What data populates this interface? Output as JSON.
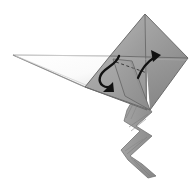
{
  "figure": {
    "title": "Origami fold step diagram",
    "domain_label": "origami-instruction",
    "background_color": "#ffffff"
  },
  "canvas": {
    "width": 196,
    "height": 183,
    "viewbox": "0 0 196 183"
  },
  "palette": {
    "paper_light": "#d2d2d2",
    "paper_mid": "#9a9a9a",
    "paper_dark": "#8a8a8a",
    "paper_shadow": "#7e7e7e",
    "paper_white": "#fbfbfb",
    "tail_fill": "#9c9c9c",
    "tail_fill_dark": "#8d8d8d",
    "outline": "#5a5a5a",
    "outline_soft": "#9d9d9d",
    "outline_faint": "#b8b8b8",
    "arrow_color": "#141414",
    "crease_dashed": "#3c3c3c",
    "background": "#ffffff"
  },
  "parts": [
    {
      "id": "upper-left-facet",
      "name": "upper-left-facet",
      "label": "Upper left triangular facet",
      "fill": "#a0a0a0",
      "points": "145,14 110,56 142,56 145,14"
    },
    {
      "id": "upper-right-facet",
      "name": "upper-right-facet",
      "label": "Upper right triangular facet",
      "fill": "#949494",
      "points": "145,14 188,58 148,58 145,14"
    },
    {
      "id": "right-body-panel",
      "name": "right-body-panel",
      "label": "Right body panel",
      "fill": "#8d8d8d",
      "points": "188,58 150,110 147,58"
    },
    {
      "id": "lower-left-panel",
      "name": "lower-left-panel",
      "label": "Lower left body panel",
      "fill": "#9f9f9f",
      "points": "110,56 85,87 146,110 147,58"
    },
    {
      "id": "center-flap",
      "name": "center-flap",
      "label": "Raised center flap",
      "fill": "#959595",
      "points": "112,58 131,60 150,110 126,96"
    },
    {
      "id": "left-white-flap",
      "name": "left-white-flap",
      "label": "Long left pointed flap",
      "fill": "#fdfdfd",
      "points": "13,55 112,56 85,87"
    },
    {
      "id": "pleated-tail",
      "name": "pleated-tail",
      "label": "Pleated accordion tail",
      "fill": "#9c9c9c",
      "points": "131,103 143,100 152,112 136,126 152,136 130,156 142,164 156,176 148,178 128,160 121,150 140,131 124,121 127,110"
    }
  ],
  "creases": [
    {
      "id": "crease-vertical-center",
      "name": "crease-vertical-center",
      "label": "Vertical center crease",
      "d": "M145,14 L146,110"
    },
    {
      "id": "crease-horizontal",
      "name": "crease-horizontal",
      "label": "Horizontal fold line",
      "d": "M110,56 L188,58"
    },
    {
      "id": "crease-dashed-flap",
      "name": "crease-dashed-flap",
      "label": "Dashed hidden crease",
      "d": "M114,60 L146,72"
    },
    {
      "id": "crease-flap-edge",
      "name": "crease-flap-edge",
      "label": "Flap left edge",
      "d": "M112,58 L126,96"
    },
    {
      "id": "crease-flap-right",
      "name": "crease-flap-right",
      "label": "Flap right edge",
      "d": "M132,61 L150,110"
    },
    {
      "id": "crease-lower-left",
      "name": "crease-lower-left",
      "label": "Lower left panel edge",
      "d": "M85,87 L146,110"
    }
  ],
  "arrows": [
    {
      "id": "arrow-left-curl",
      "name": "arrow-left-curl",
      "label": "Left curved fold-under arrow",
      "direction": "counter-clockwise-down-left",
      "color": "#141414",
      "path": "M118,57 C114,66 101,68 99,77 C97,85 105,88 110,85",
      "head": "104,89 112,83 113,90"
    },
    {
      "id": "arrow-right-up",
      "name": "arrow-right-up",
      "label": "Right curved fold-up arrow",
      "direction": "up-right",
      "color": "#141414",
      "path": "M139,77 C142,70 148,62 156,57",
      "head": "152,51 160,55 154,61"
    }
  ],
  "outlines": [
    {
      "id": "outline-main-body",
      "name": "outline-main-body",
      "label": "Main body outline",
      "d": "M145,14 L188,58 L150,110 L85,87 L110,56 Z"
    },
    {
      "id": "outline-left-flap",
      "name": "outline-left-flap",
      "label": "Left flap outline",
      "d": "M13,55 L112,56 L85,87 Z"
    }
  ]
}
